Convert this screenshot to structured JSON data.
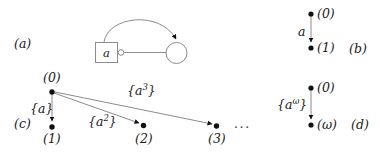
{
  "figure": {
    "background_color": "#ffffff",
    "line_color": "#8c8c8c",
    "node_color": "#111111",
    "text_color": "#1a1a1a"
  },
  "panels": {
    "a": {
      "label": "(a)",
      "box_label": "a",
      "port_icon": "hollow-circle-port-icon",
      "state_icon": "circle-state-icon",
      "edges": [
        {
          "name": "straight-edge",
          "arrow": false
        },
        {
          "name": "curved-edge",
          "arrow": true
        }
      ]
    },
    "b": {
      "label": "(b)",
      "nodes": [
        {
          "name": "node-0",
          "label": "(0)"
        },
        {
          "name": "node-1",
          "label": "(1)"
        }
      ],
      "edge_label": "a"
    },
    "c": {
      "label": "(c)",
      "nodes": [
        {
          "name": "node-0",
          "label": "(0)"
        },
        {
          "name": "node-1",
          "label": "(1)"
        },
        {
          "name": "node-2",
          "label": "(2)"
        },
        {
          "name": "node-3",
          "label": "(3)"
        }
      ],
      "edge_labels": [
        {
          "name": "edge-label-a1",
          "base": "{a}",
          "prefix": "{a",
          "exp": "",
          "suffix": "}"
        },
        {
          "name": "edge-label-a2",
          "base": "{a2}",
          "prefix": "{a",
          "exp": "2",
          "suffix": "}"
        },
        {
          "name": "edge-label-a3",
          "base": "{a3}",
          "prefix": "{a",
          "exp": "3",
          "suffix": "}"
        }
      ],
      "ellipsis": "···"
    },
    "d": {
      "label": "(d)",
      "nodes": [
        {
          "name": "node-0",
          "label": "(0)"
        },
        {
          "name": "node-omega",
          "label": "(ω)"
        }
      ],
      "edge_label": {
        "prefix": "{a",
        "exp": "ω",
        "suffix": "}"
      }
    }
  }
}
